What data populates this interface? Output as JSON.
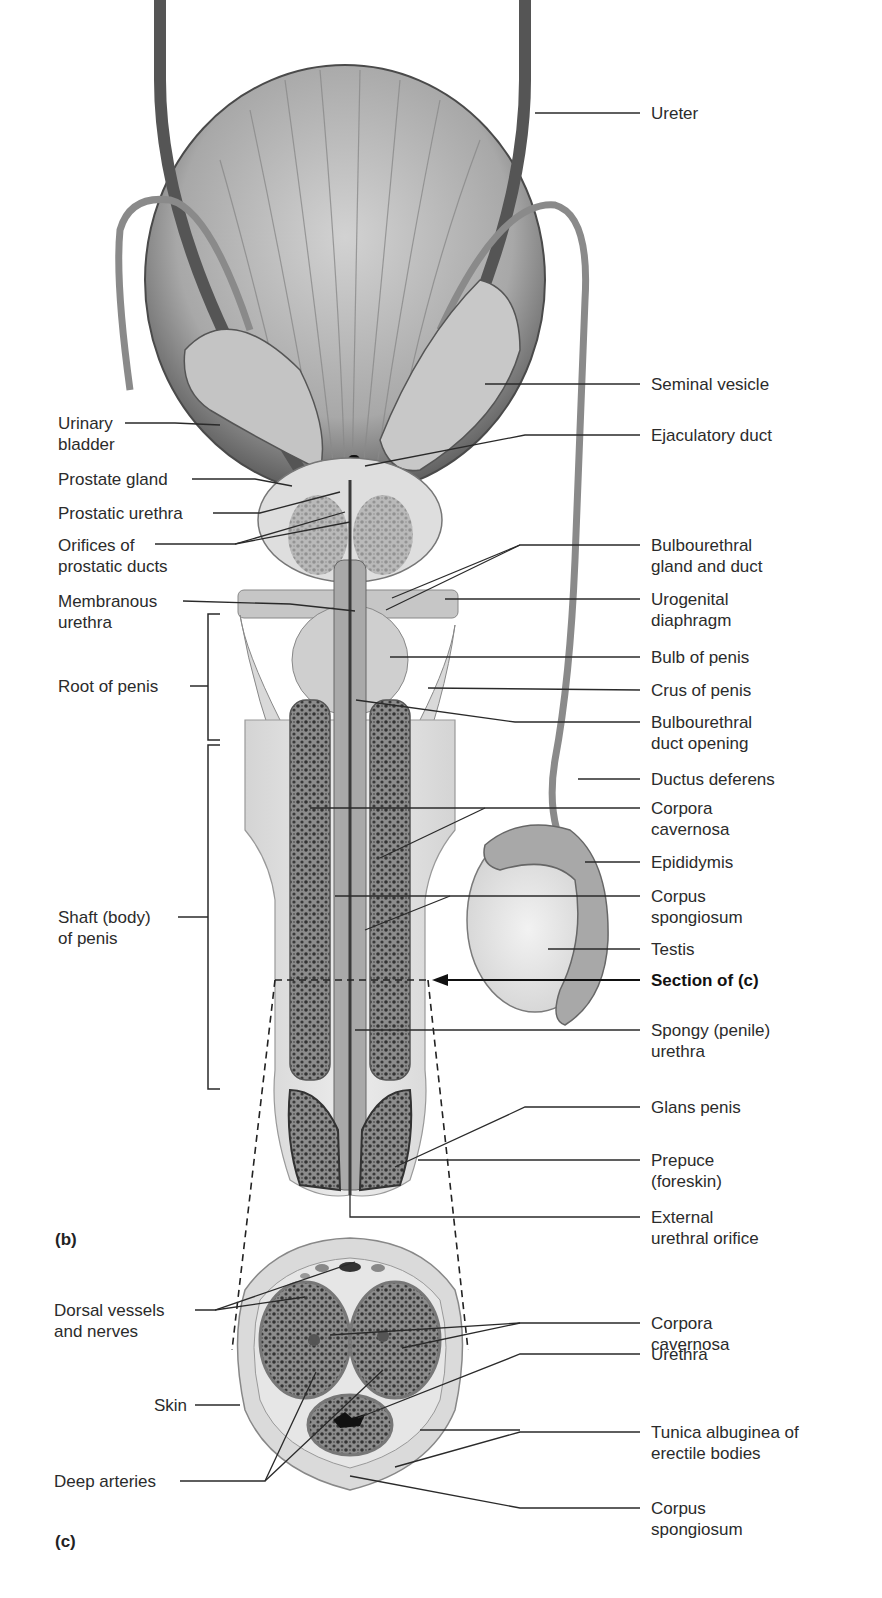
{
  "figure": {
    "panels": [
      {
        "id": "b",
        "tag": "(b)"
      },
      {
        "id": "c",
        "tag": "(c)"
      }
    ],
    "colors": {
      "ink": "#2b2b2b",
      "tissue_light": "#e8e8e8",
      "tissue_mid": "#b4b4b4",
      "tissue_dark": "#5a5a5a",
      "erectile_tissue": "#3c3c3c"
    }
  },
  "labels_left_b": {
    "urinary_bladder": "Urinary\nbladder",
    "prostate_gland": "Prostate gland",
    "prostatic_urethra": "Prostatic urethra",
    "orifices_prostatic_ducts": "Orifices of\nprostatic ducts",
    "membranous_urethra": "Membranous\nurethra",
    "root_of_penis": "Root of penis",
    "shaft_of_penis": "Shaft (body)\nof penis"
  },
  "labels_right_b": {
    "ureter": "Ureter",
    "seminal_vesicle": "Seminal vesicle",
    "ejaculatory_duct": "Ejaculatory duct",
    "bulbourethral_gland_duct": "Bulbourethral\ngland and duct",
    "urogenital_diaphragm": "Urogenital\ndiaphragm",
    "bulb_of_penis": "Bulb of penis",
    "crus_of_penis": "Crus of penis",
    "bulbourethral_duct_opening": "Bulbourethral\nduct opening",
    "ductus_deferens": "Ductus deferens",
    "corpora_cavernosa": "Corpora\ncavernosa",
    "epididymis": "Epididymis",
    "corpus_spongiosum": "Corpus\nspongiosum",
    "testis": "Testis",
    "section_of_c": "Section of (c)",
    "spongy_urethra": "Spongy (penile)\nurethra",
    "glans_penis": "Glans penis",
    "prepuce": "Prepuce\n(foreskin)",
    "external_urethral_orifice": "External\nurethral orifice"
  },
  "labels_left_c": {
    "dorsal_vessels_nerves": "Dorsal vessels\nand nerves",
    "skin": "Skin",
    "deep_arteries": "Deep arteries"
  },
  "labels_right_c": {
    "corpora_cavernosa": "Corpora\ncavernosa",
    "urethra": "Urethra",
    "tunica_albuginea": "Tunica albuginea of\nerectile bodies",
    "corpus_spongiosum": "Corpus\nspongiosum"
  }
}
